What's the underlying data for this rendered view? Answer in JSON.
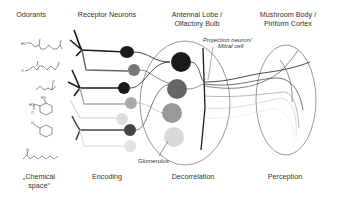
{
  "headers": {
    "odorants": "Odorants",
    "receptor_neurons": "Receptor Neurons",
    "antennal_lobe_line1": "Antennal Lobe /",
    "antennal_lobe_line2": "Olfactory Bulb",
    "mushroom_body_line1": "Mushroom Body /",
    "mushroom_body_line2": "Piriform Cortex"
  },
  "annotations": {
    "projection_neuron_line1": "Projection neuron/",
    "projection_neuron_line2": "Mitral cell",
    "glomerulus": "Glomerulus"
  },
  "stages": {
    "chemical_space_line1": "„Chemical",
    "chemical_space_line2": "space“",
    "encoding": "Encoding",
    "decorrelation": "Decorrelation",
    "perception": "Perception"
  },
  "colors": {
    "dark": "#1a1a1a",
    "mid_dark": "#555555",
    "mid": "#888888",
    "light": "#b5b5b5",
    "very_light": "#d8d8d8",
    "outline": "#555555"
  },
  "molecule_labels": {
    "ho1": "HO",
    "o2": "O",
    "ho4a": "HO",
    "ho4b": "HO",
    "o4": "O",
    "o5": "O",
    "o6": "O"
  }
}
